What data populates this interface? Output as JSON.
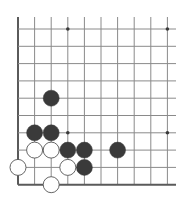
{
  "diagram": {
    "type": "go-board-fragment",
    "grid": {
      "cols": 10,
      "rows": 10,
      "x": [
        18,
        34.6,
        51.2,
        67.8,
        84.4,
        101,
        117.6,
        134.2,
        150.8,
        167.4
      ],
      "y": [
        29,
        46.3,
        63.6,
        80.9,
        98.2,
        115.5,
        132.8,
        150.1,
        167.4,
        184.7
      ],
      "line_top": 17,
      "line_right": 176,
      "edges": [
        "left",
        "bottom"
      ]
    },
    "star_points": [
      {
        "col": 3,
        "row": 0
      },
      {
        "col": 9,
        "row": 0
      },
      {
        "col": 3,
        "row": 6
      },
      {
        "col": 9,
        "row": 6
      }
    ],
    "stones": [
      {
        "color": "black",
        "col": 2,
        "row": 4
      },
      {
        "color": "black",
        "col": 1,
        "row": 6
      },
      {
        "color": "black",
        "col": 2,
        "row": 6
      },
      {
        "color": "white",
        "col": 1,
        "row": 7
      },
      {
        "color": "white",
        "col": 2,
        "row": 7
      },
      {
        "color": "black",
        "col": 3,
        "row": 7
      },
      {
        "color": "black",
        "col": 4,
        "row": 7
      },
      {
        "color": "black",
        "col": 6,
        "row": 7
      },
      {
        "color": "white",
        "col": 0,
        "row": 8
      },
      {
        "color": "white",
        "col": 3,
        "row": 8
      },
      {
        "color": "black",
        "col": 4,
        "row": 8
      },
      {
        "color": "white",
        "col": 2,
        "row": 9
      }
    ],
    "colors": {
      "grid_line": "#8a8a8a",
      "edge_line": "#5a5a5a",
      "black_stone": "#3a3a3a",
      "white_stone": "#ffffff",
      "white_stone_border": "#555555",
      "star_point": "#3a3a3a"
    },
    "stone_radius": 8
  }
}
